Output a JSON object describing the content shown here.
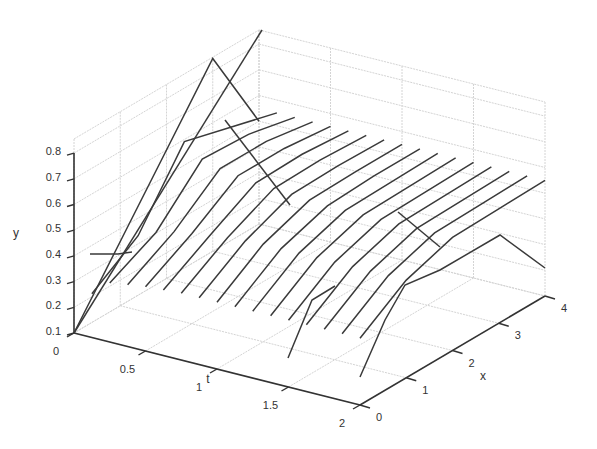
{
  "chart_data": {
    "type": "line3d",
    "title": "",
    "xlabel": "t",
    "ylabel": "x",
    "zlabel": "y",
    "t_ticks": [
      "0",
      "0.5",
      "1",
      "1.5",
      "2"
    ],
    "x_ticks": [
      "0",
      "1",
      "2",
      "3",
      "4"
    ],
    "y_ticks": [
      "0.1",
      "0.2",
      "0.3",
      "0.4",
      "0.5",
      "0.6",
      "0.7",
      "0.8"
    ],
    "t_range": [
      0,
      2
    ],
    "x_range": [
      0,
      4
    ],
    "y_range": [
      0.1,
      0.855
    ],
    "grid": true,
    "x_nodes": [
      0,
      1,
      2,
      3,
      4
    ],
    "series": [
      {
        "t": 0.0,
        "y": [
          0.1,
          0.35,
          0.6,
          0.85,
          0.5
        ]
      },
      {
        "t": 0.125,
        "y": [
          0.27,
          0.39,
          0.65,
          0.6,
          0.55
        ]
      },
      {
        "t": 0.25,
        "y": [
          0.33,
          0.42,
          0.6,
          0.59,
          0.55
        ]
      },
      {
        "t": 0.375,
        "y": [
          0.34,
          0.44,
          0.58,
          0.58,
          0.55
        ]
      },
      {
        "t": 0.5,
        "y": [
          0.35,
          0.45,
          0.57,
          0.57,
          0.55
        ]
      },
      {
        "t": 0.625,
        "y": [
          0.355,
          0.46,
          0.56,
          0.565,
          0.55
        ]
      },
      {
        "t": 0.75,
        "y": [
          0.36,
          0.47,
          0.555,
          0.56,
          0.55
        ]
      },
      {
        "t": 0.875,
        "y": [
          0.36,
          0.475,
          0.55,
          0.555,
          0.55
        ]
      },
      {
        "t": 1.0,
        "y": [
          0.36,
          0.48,
          0.545,
          0.55,
          0.55
        ]
      },
      {
        "t": 1.125,
        "y": [
          0.36,
          0.48,
          0.54,
          0.55,
          0.55
        ]
      },
      {
        "t": 1.25,
        "y": [
          0.36,
          0.48,
          0.54,
          0.545,
          0.55
        ]
      },
      {
        "t": 1.375,
        "y": [
          0.36,
          0.48,
          0.54,
          0.545,
          0.55
        ]
      },
      {
        "t": 1.5,
        "y": [
          0.36,
          0.48,
          0.54,
          0.545,
          0.55
        ]
      },
      {
        "t": 1.625,
        "y": [
          0.36,
          0.48,
          0.54,
          0.545,
          0.55
        ]
      },
      {
        "t": 1.75,
        "y": [
          0.36,
          0.48,
          0.54,
          0.545,
          0.55
        ]
      },
      {
        "t": 1.875,
        "y": [
          0.36,
          0.48,
          0.54,
          0.545,
          0.55
        ]
      },
      {
        "t": 2.0,
        "y": [
          0.36,
          0.48,
          0.54,
          0.545,
          0.55
        ]
      }
    ],
    "t_profiles": [
      {
        "x": 0,
        "points": [
          [
            0,
            0.1
          ],
          [
            0.125,
            0.27
          ],
          [
            0.25,
            0.33
          ],
          [
            0.5,
            0.35
          ],
          [
            0.75,
            0.36
          ],
          [
            1.0,
            0.36
          ],
          [
            1.25,
            0.36
          ],
          [
            1.5,
            0.36
          ],
          [
            2.0,
            0.36
          ]
        ],
        "note": "boundary x=0 follows boundary condition"
      },
      {
        "x": 1,
        "points": [
          [
            0,
            0.35
          ],
          [
            1.6,
            0.1
          ],
          [
            1.85,
            0.3
          ],
          [
            2.0,
            0.5
          ]
        ],
        "note": "extra strand"
      },
      {
        "x": 0,
        "line": "initial ramp",
        "points": [
          [
            0,
            0.1
          ],
          [
            0,
            0.35
          ],
          [
            0,
            0.6
          ],
          [
            0,
            0.85
          ]
        ]
      }
    ]
  }
}
